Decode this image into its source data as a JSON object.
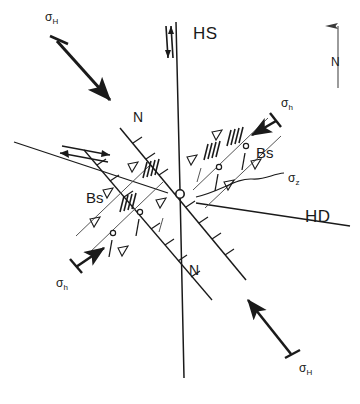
{
  "figure": {
    "type": "structural-geology-block-diagram",
    "background_color": "#ffffff",
    "line_color": "#1a1a1a"
  },
  "labels": {
    "hs": "HS",
    "hd": "HD",
    "normal_fault_upper": "N",
    "normal_fault_lower": "N",
    "bookshelf_upper_right": "Bs",
    "bookshelf_lower_left": "Bs",
    "compass_north": "N"
  },
  "stress_axes": [
    {
      "id": "sigma-H-upper-left",
      "symbol": "σ",
      "subscript": "H",
      "label": "σH",
      "description": "maximum horizontal stress, arrow pointing SE",
      "x": 45,
      "y": 18
    },
    {
      "id": "sigma-h-upper-right",
      "symbol": "σ",
      "subscript": "h",
      "label": "σh",
      "description": "minimum horizontal stress, arrow pointing SW",
      "x": 281,
      "y": 104
    },
    {
      "id": "sigma-z-center-right",
      "symbol": "σ",
      "subscript": "z",
      "label": "σz",
      "description": "vertical stress, wavy leader line to fracture plane",
      "x": 286,
      "y": 178
    },
    {
      "id": "sigma-h-lower-left",
      "symbol": "σ",
      "subscript": "h",
      "label": "σh",
      "description": "minimum horizontal stress, arrow pointing NE",
      "x": 56,
      "y": 275
    },
    {
      "id": "sigma-H-lower-right",
      "symbol": "σ",
      "subscript": "H",
      "label": "σH",
      "description": "maximum horizontal stress, arrow pointing NW",
      "x": 299,
      "y": 364
    }
  ],
  "structures": [
    {
      "id": "hs-fault",
      "name": "HS",
      "kind": "strike-slip fault",
      "orientation": "near-vertical N-S",
      "shear_sense": "sinistral-dextral arrow pair"
    },
    {
      "id": "hd-fault",
      "name": "HD",
      "kind": "strike-slip fault",
      "orientation": "WNW-ESE",
      "shear_sense": "double half-arrow pair"
    },
    {
      "id": "normal-fault-set",
      "name": "N",
      "kind": "normal fault",
      "orientation": "NNW-SSE",
      "ornament": "hachure ticks on downthrown side",
      "count": 2
    },
    {
      "id": "bookshelf-upper",
      "name": "Bs",
      "kind": "bookshelf structure",
      "quadrant": "upper-right",
      "ornament": "open triangles, hatched bars, circles"
    },
    {
      "id": "bookshelf-lower",
      "name": "Bs",
      "kind": "bookshelf structure",
      "quadrant": "lower-left",
      "ornament": "open triangles, hatched bars, circles"
    }
  ],
  "compass": {
    "label": "N",
    "direction": "north",
    "x": 334,
    "y": 18
  }
}
